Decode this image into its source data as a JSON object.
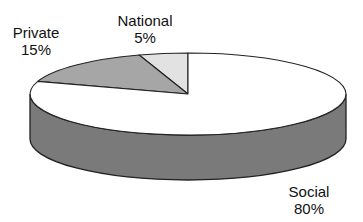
{
  "chart_data": {
    "type": "pie",
    "style": "3d",
    "title": "",
    "categories": [
      "Social",
      "Private",
      "National"
    ],
    "values": [
      80,
      15,
      5
    ],
    "labels": [
      "Social 80%",
      "Private 15%",
      "National 5%"
    ],
    "colors": {
      "Social": "#ffffff",
      "Private": "#a6a6a6",
      "National": "#e2e2e2",
      "rim": "#7a7a7a"
    }
  },
  "labels": {
    "social": {
      "name": "Social",
      "pct": "80%"
    },
    "private": {
      "name": "Private",
      "pct": "15%"
    },
    "national": {
      "name": "National",
      "pct": "5%"
    }
  }
}
